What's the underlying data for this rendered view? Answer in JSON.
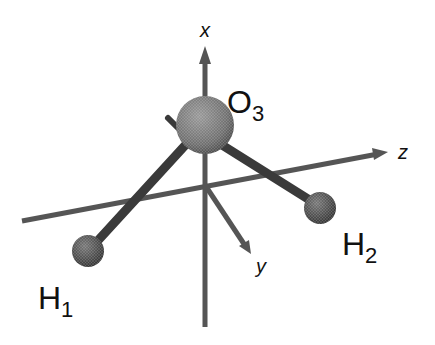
{
  "diagram": {
    "type": "molecular-geometry",
    "axes": {
      "x": {
        "label": "x"
      },
      "y": {
        "label": "y"
      },
      "z": {
        "label": "z"
      }
    },
    "atoms": [
      {
        "id": "O3",
        "element": "O",
        "index": "3"
      },
      {
        "id": "H1",
        "element": "H",
        "index": "1"
      },
      {
        "id": "H2",
        "element": "H",
        "index": "2"
      }
    ],
    "bonds": [
      {
        "from": "O3",
        "to": "H1"
      },
      {
        "from": "O3",
        "to": "H2"
      }
    ],
    "colors": {
      "axis": "#555555",
      "bond": "#3a3a3a",
      "oxygen": "#7a7a7a",
      "hydrogen": "#4a4a4a",
      "text": "#111111"
    }
  }
}
